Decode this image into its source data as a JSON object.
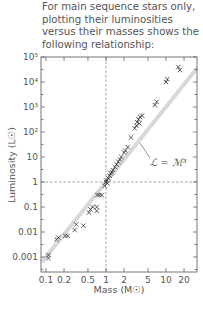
{
  "caption": "For main sequence stars only, plotting their luminosities versus their masses shows the following relationship:",
  "chart_data": {
    "type": "scatter",
    "title": "",
    "xlabel": "Mass (M☉)",
    "ylabel": "Luminosity (L☉)",
    "xscale": "log",
    "yscale": "log",
    "xlim": [
      0.083,
      33
    ],
    "ylim": [
      0.0003,
      100000
    ],
    "x_ticks": [
      0.1,
      0.2,
      0.5,
      1,
      2,
      5,
      10,
      20
    ],
    "x_tick_labels": [
      "0.1",
      "0.2",
      "0.5",
      "1",
      "2",
      "5",
      "10",
      "20"
    ],
    "y_ticks": [
      0.001,
      0.01,
      0.1,
      1,
      10,
      100,
      1000,
      10000,
      100000
    ],
    "y_tick_labels": [
      "0.001",
      "0.01",
      "0.1",
      "1",
      "10",
      "10²",
      "10³",
      "10⁴",
      "10⁵"
    ],
    "reference_lines": [
      {
        "type": "vertical",
        "x": 1,
        "style": "dashed"
      },
      {
        "type": "horizontal",
        "y": 1,
        "style": "dashed"
      }
    ],
    "fit_line": {
      "label": "ℒ = ℳ³",
      "equation": "L = M^3",
      "color": "#d8d8d8"
    },
    "series": [
      {
        "name": "Main sequence stars",
        "marker": "x",
        "points": [
          [
            0.11,
            0.0012
          ],
          [
            0.11,
            0.0009
          ],
          [
            0.16,
            0.006
          ],
          [
            0.15,
            0.005
          ],
          [
            0.21,
            0.007
          ],
          [
            0.23,
            0.007
          ],
          [
            0.3,
            0.012
          ],
          [
            0.32,
            0.02
          ],
          [
            0.42,
            0.018
          ],
          [
            0.52,
            0.06
          ],
          [
            0.55,
            0.08
          ],
          [
            0.6,
            0.1
          ],
          [
            0.7,
            0.1
          ],
          [
            0.7,
            0.07
          ],
          [
            0.72,
            0.3
          ],
          [
            0.78,
            0.3
          ],
          [
            0.85,
            0.3
          ],
          [
            0.95,
            0.7
          ],
          [
            1.0,
            1.0
          ],
          [
            1.02,
            1.2
          ],
          [
            1.05,
            0.9
          ],
          [
            1.1,
            1.4
          ],
          [
            1.15,
            1.8
          ],
          [
            1.2,
            2.2
          ],
          [
            1.25,
            2.5
          ],
          [
            1.3,
            3.0
          ],
          [
            1.4,
            4.0
          ],
          [
            1.5,
            5.0
          ],
          [
            1.6,
            6.5
          ],
          [
            1.7,
            8.0
          ],
          [
            1.8,
            10
          ],
          [
            2.0,
            15
          ],
          [
            2.1,
            18
          ],
          [
            2.3,
            25
          ],
          [
            2.6,
            60
          ],
          [
            3.0,
            140
          ],
          [
            3.2,
            180
          ],
          [
            3.3,
            250
          ],
          [
            3.5,
            320
          ],
          [
            3.6,
            220
          ],
          [
            3.7,
            400
          ],
          [
            4.0,
            450
          ],
          [
            6.5,
            1200
          ],
          [
            7.0,
            1600
          ],
          [
            10,
            10000
          ],
          [
            10.5,
            13000
          ],
          [
            16,
            40000
          ],
          [
            17,
            30000
          ]
        ]
      }
    ],
    "grid": false,
    "legend": "none"
  }
}
